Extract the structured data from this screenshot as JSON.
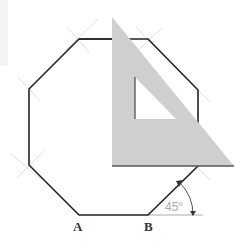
{
  "diagram": {
    "labels": {
      "vertex_a": "A",
      "vertex_b": "B",
      "angle": "45°"
    },
    "colors": {
      "octagon_stroke": "#222222",
      "set_square_fill": "#cfcfcf",
      "set_square_edge": "#555555",
      "construction_marks": "#dddddd",
      "angle_color": "#aaaaaa",
      "label_color": "#333333"
    },
    "octagon_vertices": [
      [
        79,
        39
      ],
      [
        148,
        39
      ],
      [
        198,
        90
      ],
      [
        198,
        166
      ],
      [
        148,
        215
      ],
      [
        79,
        215
      ],
      [
        29,
        165
      ],
      [
        29,
        89
      ]
    ],
    "set_square": {
      "outer": [
        [
          112,
          17
        ],
        [
          112,
          166
        ],
        [
          234,
          166
        ]
      ],
      "inner_cutout": [
        [
          135,
          77
        ],
        [
          135,
          119
        ],
        [
          176,
          119
        ]
      ]
    }
  }
}
